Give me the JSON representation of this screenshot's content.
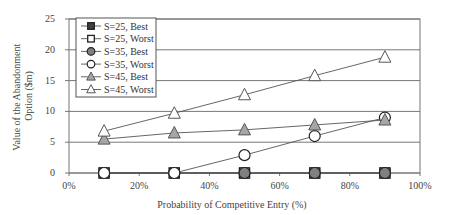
{
  "chart_data": {
    "type": "line",
    "title": "",
    "xlabel": "Probability of Competitive Entry (%)",
    "ylabel_lines": [
      "Value of the Abandonment",
      "Option ($m)"
    ],
    "ylabel": "Value of the Abandonment Option ($m)",
    "xlim": [
      0,
      100
    ],
    "ylim": [
      0,
      25
    ],
    "x_ticks": [
      0,
      20,
      40,
      60,
      80,
      100
    ],
    "x_tick_labels": [
      "0%",
      "20%",
      "40%",
      "60%",
      "80%",
      "100%"
    ],
    "y_ticks": [
      0,
      5,
      10,
      15,
      20,
      25
    ],
    "y_tick_labels": [
      "0",
      "5",
      "10",
      "15",
      "20",
      "25"
    ],
    "grid": "horizontal",
    "legend_position": "upper-left inside",
    "x": [
      10,
      30,
      50,
      70,
      90
    ],
    "series": [
      {
        "name": "S=25, Best",
        "marker": "square",
        "fill": "#404040",
        "values": [
          0,
          0,
          0,
          0,
          0
        ]
      },
      {
        "name": "S=25, Worst",
        "marker": "square",
        "fill": "#ffffff",
        "values": [
          0,
          0,
          0,
          0,
          0
        ]
      },
      {
        "name": "S=35, Best",
        "marker": "circle",
        "fill": "#808080",
        "values": [
          0,
          0,
          0,
          0,
          0
        ]
      },
      {
        "name": "S=35, Worst",
        "marker": "circle",
        "fill": "#ffffff",
        "values": [
          0,
          0,
          2.9,
          6.0,
          9.0
        ]
      },
      {
        "name": "S=45, Best",
        "marker": "triangle",
        "fill": "#a6a6a6",
        "values": [
          5.5,
          6.5,
          7.0,
          7.8,
          8.6
        ]
      },
      {
        "name": "S=45, Worst",
        "marker": "triangle",
        "fill": "#ffffff",
        "values": [
          6.8,
          9.7,
          12.7,
          15.8,
          18.8
        ]
      }
    ]
  }
}
